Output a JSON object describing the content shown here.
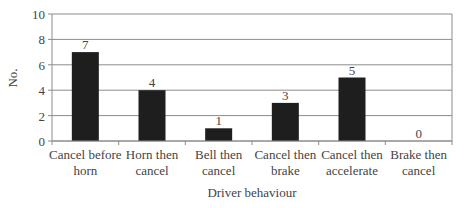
{
  "chart_data": {
    "type": "bar",
    "title": "",
    "xlabel": "Driver behaviour",
    "ylabel": "No.",
    "ylim": [
      0,
      10
    ],
    "yticks": [
      0,
      2,
      4,
      6,
      8,
      10
    ],
    "grid": true,
    "legend": null,
    "categories": [
      [
        "Cancel before",
        "horn"
      ],
      [
        "Horn then",
        "cancel"
      ],
      [
        "Bell then",
        "cancel"
      ],
      [
        "Cancel then",
        "brake"
      ],
      [
        "Cancel then",
        "accelerate"
      ],
      [
        "Brake then",
        "cancel"
      ]
    ],
    "category_labels": [
      "Cancel before horn",
      "Horn then cancel",
      "Bell then cancel",
      "Cancel then brake",
      "Cancel then accelerate",
      "Brake then cancel"
    ],
    "values": [
      7,
      4,
      1,
      3,
      5,
      0
    ],
    "data_labels": [
      "7",
      "4",
      "1",
      "3",
      "5",
      "0"
    ],
    "colors": {
      "bar": "#1e1e1e",
      "grid": "#8c8c8c",
      "axis": "#8c8c8c",
      "text": "#444444"
    }
  }
}
